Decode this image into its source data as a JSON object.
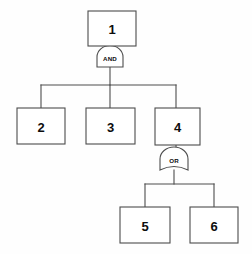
{
  "diagram": {
    "type": "fault-tree",
    "title": "",
    "background_color": "#fefefe",
    "stroke_color": "#4c4c4c",
    "text_color": "#0d0d0d",
    "nodes": [
      {
        "id": "n1",
        "label": "1",
        "x": 88,
        "y": 11,
        "w": 48,
        "h": 35
      },
      {
        "id": "n2",
        "label": "2",
        "x": 17,
        "y": 108,
        "w": 48,
        "h": 36
      },
      {
        "id": "n3",
        "label": "3",
        "x": 86,
        "y": 108,
        "w": 49,
        "h": 36
      },
      {
        "id": "n4",
        "label": "4",
        "x": 155,
        "y": 108,
        "w": 45,
        "h": 37
      },
      {
        "id": "n5",
        "label": "5",
        "x": 120,
        "y": 207,
        "w": 50,
        "h": 36
      },
      {
        "id": "n6",
        "label": "6",
        "x": 190,
        "y": 207,
        "w": 48,
        "h": 36
      }
    ],
    "gates": [
      {
        "id": "g1",
        "label": "AND",
        "kind": "and",
        "x": 97,
        "y": 46,
        "w": 26,
        "h": 21
      },
      {
        "id": "g2",
        "label": "OR",
        "kind": "or",
        "x": 160,
        "y": 147,
        "w": 28,
        "h": 25
      }
    ],
    "edges": [
      {
        "from": "n1",
        "to": "g1"
      },
      {
        "from": "g1",
        "to": "n2"
      },
      {
        "from": "g1",
        "to": "n3"
      },
      {
        "from": "g1",
        "to": "n4"
      },
      {
        "from": "n4",
        "to": "g2"
      },
      {
        "from": "g2",
        "to": "n5"
      },
      {
        "from": "g2",
        "to": "n6"
      }
    ]
  }
}
